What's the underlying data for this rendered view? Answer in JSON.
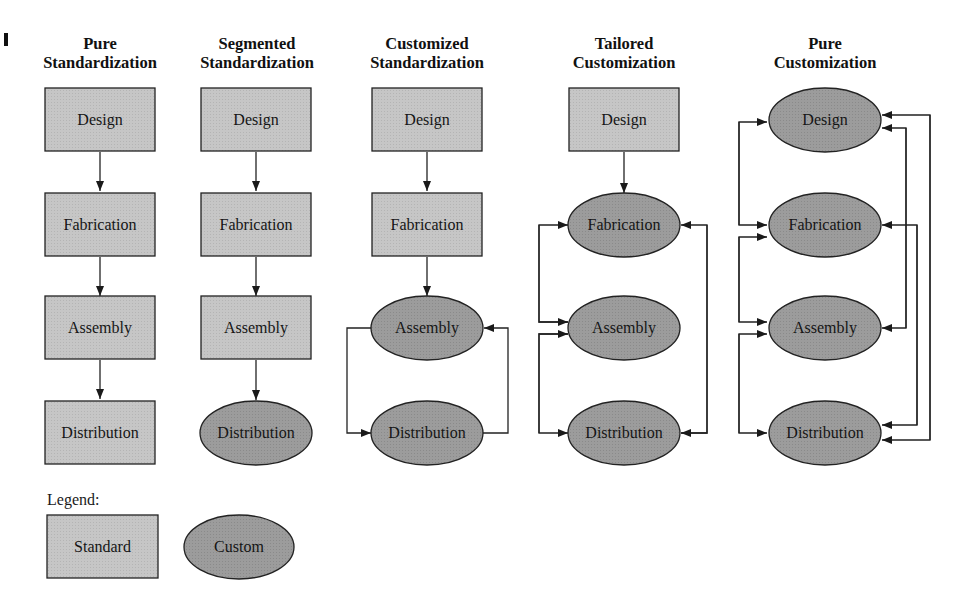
{
  "columns": [
    {
      "title_line1": "Pure",
      "title_line2": "Standardization",
      "nodes": [
        {
          "label": "Design",
          "type": "standard"
        },
        {
          "label": "Fabrication",
          "type": "standard"
        },
        {
          "label": "Assembly",
          "type": "standard"
        },
        {
          "label": "Distribution",
          "type": "standard"
        }
      ]
    },
    {
      "title_line1": "Segmented",
      "title_line2": "Standardization",
      "nodes": [
        {
          "label": "Design",
          "type": "standard"
        },
        {
          "label": "Fabrication",
          "type": "standard"
        },
        {
          "label": "Assembly",
          "type": "standard"
        },
        {
          "label": "Distribution",
          "type": "custom"
        }
      ]
    },
    {
      "title_line1": "Customized",
      "title_line2": "Standardization",
      "nodes": [
        {
          "label": "Design",
          "type": "standard"
        },
        {
          "label": "Fabrication",
          "type": "standard"
        },
        {
          "label": "Assembly",
          "type": "custom"
        },
        {
          "label": "Distribution",
          "type": "custom"
        }
      ]
    },
    {
      "title_line1": "Tailored",
      "title_line2": "Customization",
      "nodes": [
        {
          "label": "Design",
          "type": "standard"
        },
        {
          "label": "Fabrication",
          "type": "custom"
        },
        {
          "label": "Assembly",
          "type": "custom"
        },
        {
          "label": "Distribution",
          "type": "custom"
        }
      ]
    },
    {
      "title_line1": "Pure",
      "title_line2": "Customization",
      "nodes": [
        {
          "label": "Design",
          "type": "custom"
        },
        {
          "label": "Fabrication",
          "type": "custom"
        },
        {
          "label": "Assembly",
          "type": "custom"
        },
        {
          "label": "Distribution",
          "type": "custom"
        }
      ]
    }
  ],
  "legend": {
    "title": "Legend:",
    "standard_label": "Standard",
    "custom_label": "Custom"
  },
  "colors": {
    "standard_fill": "#c4c4c4",
    "custom_fill": "#9a9a9a",
    "stroke": "#222222"
  }
}
